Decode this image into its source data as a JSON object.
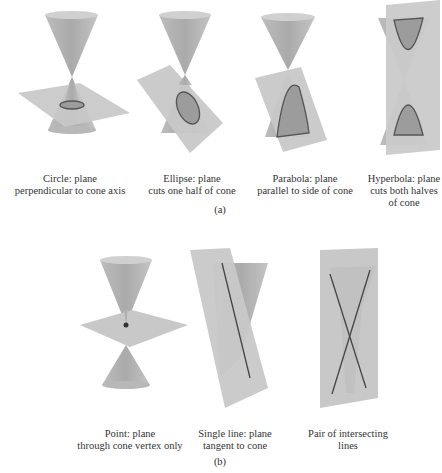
{
  "panel_a": {
    "label": "(a)",
    "items": [
      {
        "id": "circle",
        "caption_line1": "Circle: plane",
        "caption_line2": "perpendicular to cone axis",
        "caption_line3": ""
      },
      {
        "id": "ellipse",
        "caption_line1": "Ellipse: plane",
        "caption_line2": "cuts one half of cone",
        "caption_line3": ""
      },
      {
        "id": "parabola",
        "caption_line1": "Parabola: plane",
        "caption_line2": "parallel to side of cone",
        "caption_line3": ""
      },
      {
        "id": "hyperbola",
        "caption_line1": "Hyperbola: plane",
        "caption_line2": "cuts both halves",
        "caption_line3": "of cone"
      }
    ]
  },
  "panel_b": {
    "label": "(b)",
    "items": [
      {
        "id": "point",
        "caption_line1": "Point: plane",
        "caption_line2": "through cone vertex only"
      },
      {
        "id": "single-line",
        "caption_line1": "Single line: plane",
        "caption_line2": "tangent to cone"
      },
      {
        "id": "intersecting-lines",
        "caption_line1": "Pair of intersecting",
        "caption_line2": "lines"
      }
    ]
  },
  "colors": {
    "cone": "#b4b4b4",
    "cone_top": "#d2d2d2",
    "plane": "#c6c6c6",
    "curve": "#555555",
    "section_fill": "#9a9a9a"
  }
}
